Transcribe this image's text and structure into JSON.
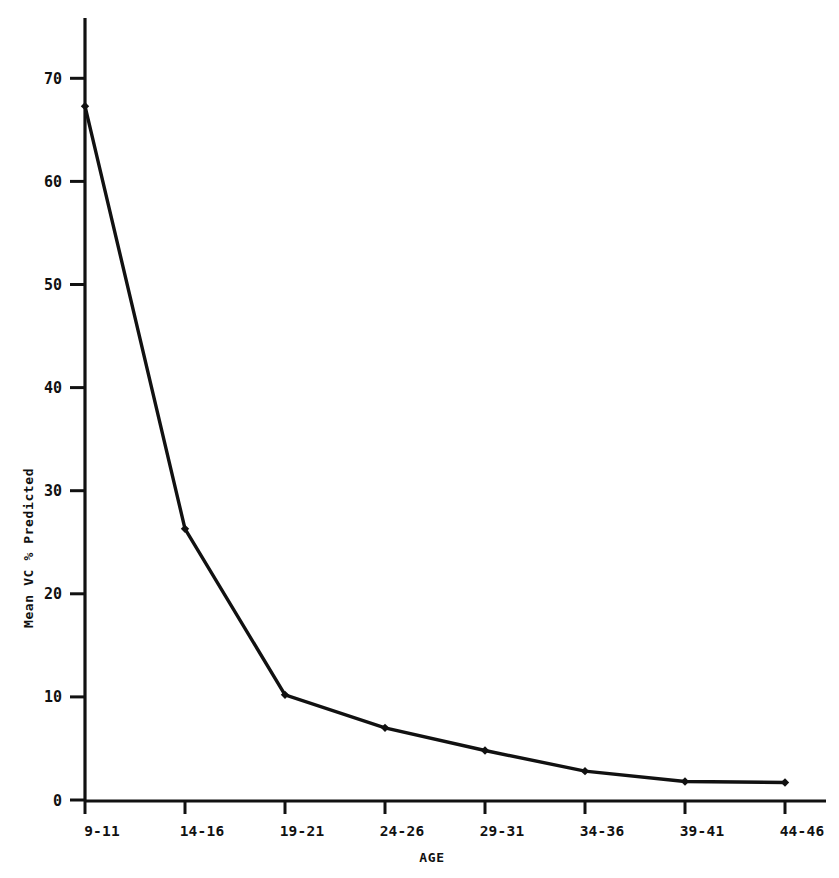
{
  "chart_data": {
    "type": "line",
    "title": "",
    "subtitle": "",
    "xlabel": "AGE",
    "ylabel": "Mean VC % Predicted",
    "categories": [
      "9-11",
      "14-16",
      "19-21",
      "24-26",
      "29-31",
      "34-36",
      "39-41",
      "44-46"
    ],
    "values": [
      67.3,
      26.3,
      10.2,
      7.0,
      4.8,
      2.8,
      1.8,
      1.7
    ],
    "series": [
      {
        "name": "Mean VC % Predicted",
        "values": [
          67.3,
          26.3,
          10.2,
          7.0,
          4.8,
          2.8,
          1.8,
          1.7
        ]
      }
    ],
    "ylim": [
      0,
      75
    ],
    "yticks": [
      0,
      10,
      20,
      30,
      40,
      50,
      60,
      70
    ],
    "ytick_labels": [
      "0",
      "10",
      "20",
      "30",
      "40",
      "50",
      "60",
      "70"
    ],
    "xtick_labels": [
      "9-11",
      "14-16",
      "19-21",
      "24-26",
      "29-31",
      "34-36",
      "39-41",
      "44-46"
    ],
    "grid": false,
    "legend": null,
    "legend_position": "none",
    "marker": "filled-diamond",
    "line_color": "#111111",
    "marker_color": "#111111",
    "axis_color": "#111111",
    "background_color": "#ffffff",
    "annotations": []
  },
  "axes": {
    "y_axis_title": "Mean VC % Predicted",
    "x_axis_title": "AGE"
  }
}
